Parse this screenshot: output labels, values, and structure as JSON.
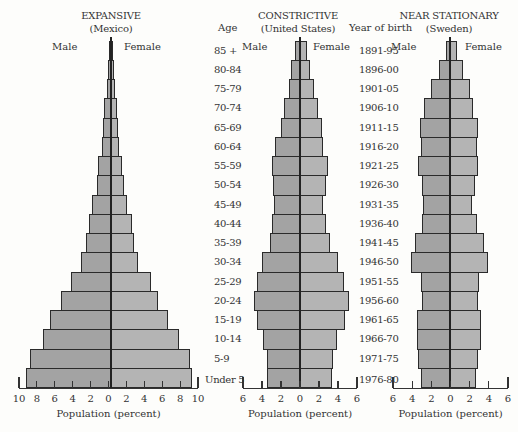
{
  "chart_data": [
    {
      "type": "bar",
      "subtype": "population-pyramid",
      "title": "EXPANSIVE",
      "subtitle": "(Mexico)",
      "left_label": "Male",
      "right_label": "Female",
      "xlabel": "Population (percent)",
      "ylabel": "Age",
      "xlim": [
        -10,
        10
      ],
      "ticks": [
        "10",
        "8",
        "6",
        "4",
        "2",
        "0",
        "2",
        "4",
        "6",
        "8",
        "10"
      ],
      "categories": [
        "85 +",
        "80-84",
        "75-79",
        "70-74",
        "65-69",
        "60-64",
        "55-59",
        "50-54",
        "45-49",
        "40-44",
        "35-39",
        "30-34",
        "25-29",
        "20-24",
        "15-19",
        "10-14",
        "5-9",
        "Under 5"
      ],
      "series": [
        {
          "name": "Male",
          "values": [
            0.25,
            0.3,
            0.5,
            0.75,
            0.9,
            1.0,
            1.4,
            1.6,
            2.1,
            2.5,
            2.8,
            3.3,
            4.5,
            5.6,
            6.8,
            7.6,
            9.0,
            9.5
          ]
        },
        {
          "name": "Female",
          "values": [
            0.25,
            0.3,
            0.45,
            0.65,
            0.8,
            0.9,
            1.2,
            1.5,
            1.8,
            2.3,
            2.6,
            3.0,
            4.5,
            5.3,
            6.4,
            7.6,
            8.8,
            9.1
          ]
        }
      ]
    },
    {
      "type": "bar",
      "subtype": "population-pyramid",
      "title": "CONSTRICTIVE",
      "subtitle": "(United States)",
      "left_label": "Male",
      "right_label": "Female",
      "xlabel": "Population (percent)",
      "xlim": [
        -6,
        6
      ],
      "ticks": [
        "6",
        "4",
        "2",
        "0",
        "2",
        "4",
        "6"
      ],
      "categories": [
        "85 +",
        "80-84",
        "75-79",
        "70-74",
        "65-69",
        "60-64",
        "55-59",
        "50-54",
        "45-49",
        "40-44",
        "35-39",
        "30-34",
        "25-29",
        "20-24",
        "15-19",
        "10-14",
        "5-9",
        "Under 5"
      ],
      "series": [
        {
          "name": "Male",
          "values": [
            0.5,
            0.9,
            1.2,
            1.7,
            2.0,
            2.6,
            3.0,
            2.9,
            2.7,
            3.0,
            3.2,
            4.0,
            4.6,
            4.9,
            4.6,
            3.9,
            3.5,
            3.5
          ]
        },
        {
          "name": "Female",
          "values": [
            0.7,
            1.1,
            1.5,
            1.9,
            2.3,
            2.4,
            3.0,
            2.8,
            2.4,
            2.7,
            3.2,
            4.0,
            4.7,
            5.2,
            4.8,
            3.9,
            3.5,
            3.4
          ]
        }
      ]
    },
    {
      "type": "bar",
      "subtype": "population-pyramid",
      "title": "NEAR STATIONARY",
      "subtitle": "(Sweden)",
      "left_label": "Male",
      "right_label": "Female",
      "xlabel": "Population (percent)",
      "ylabel": "Year of birth",
      "xlim": [
        -6,
        6
      ],
      "ticks": [
        "6",
        "4",
        "2",
        "0",
        "2",
        "4",
        "6"
      ],
      "categories": [
        "1891-95",
        "1896-00",
        "1901-05",
        "1906-10",
        "1911-15",
        "1916-20",
        "1921-25",
        "1926-30",
        "1931-35",
        "1936-40",
        "1941-45",
        "1946-50",
        "1951-55",
        "1956-60",
        "1961-65",
        "1966-70",
        "1971-75",
        "1976-80"
      ],
      "series": [
        {
          "name": "Male",
          "values": [
            0.4,
            1.1,
            2.0,
            2.7,
            3.1,
            3.0,
            3.3,
            2.9,
            2.8,
            2.9,
            3.7,
            4.1,
            3.0,
            2.9,
            3.5,
            3.5,
            3.3,
            3.0
          ]
        },
        {
          "name": "Female",
          "values": [
            0.7,
            1.4,
            2.1,
            2.4,
            2.9,
            2.8,
            2.9,
            2.6,
            2.3,
            2.8,
            3.6,
            4.0,
            3.0,
            2.9,
            3.2,
            3.2,
            2.9,
            2.7
          ]
        }
      ]
    }
  ],
  "labels": {
    "age_header": "Age",
    "year_header": "Year of birth"
  }
}
